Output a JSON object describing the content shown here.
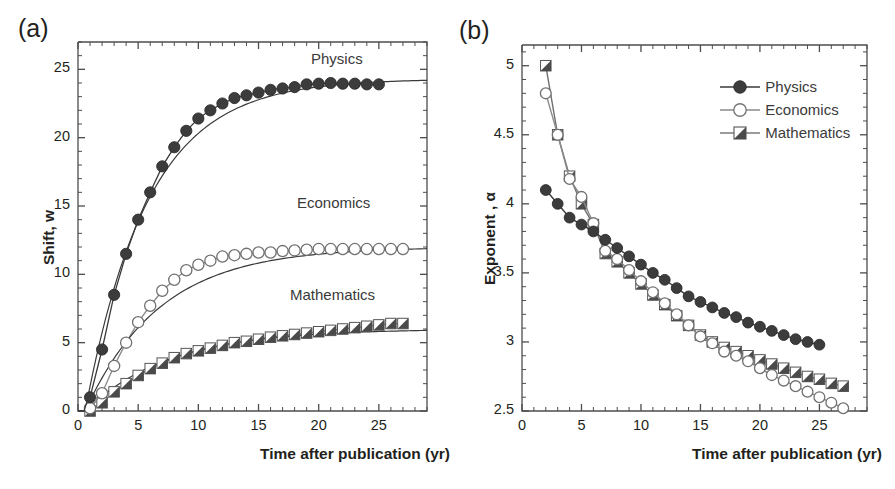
{
  "figure": {
    "panels": [
      {
        "tag": "(a)",
        "xlabel": "Time after publication (yr)",
        "ylabel": "Shift, w",
        "xticks": [
          0,
          5,
          10,
          15,
          20,
          25
        ],
        "yticks": [
          0,
          5,
          10,
          15,
          20,
          25
        ],
        "inplot_labels": [
          "Physics",
          "Economics",
          "Mathematics"
        ]
      },
      {
        "tag": "(b)",
        "xlabel": "Time after publication (yr)",
        "ylabel": "Exponent , α",
        "xticks": [
          0,
          5,
          10,
          15,
          20,
          25
        ],
        "yticks": [
          "2.5",
          "3",
          "3.5",
          "4",
          "4.5",
          "5"
        ],
        "legend": [
          "Physics",
          "Economics",
          "Mathematics"
        ]
      }
    ]
  },
  "colors": {
    "physics": "#3c3c3c",
    "economics": "#ffffff",
    "economics_edge": "#707070",
    "mathematics_fill": "#4a4a4a",
    "mathematics_edge": "#555555",
    "axis": "#4d4d4d",
    "text": "#231f20",
    "fitline": "#3a3a3a"
  },
  "chart_data": [
    {
      "type": "scatter",
      "panel": "a",
      "title": "",
      "xlabel": "Time after publication (yr)",
      "ylabel": "Shift, w",
      "xlim": [
        0,
        29
      ],
      "ylim": [
        0,
        27
      ],
      "grid": false,
      "legend_position": "in-plot annotations at right",
      "x": [
        1,
        2,
        3,
        4,
        5,
        6,
        7,
        8,
        9,
        10,
        11,
        12,
        13,
        14,
        15,
        16,
        17,
        18,
        19,
        20,
        21,
        22,
        23,
        24,
        25
      ],
      "series": [
        {
          "name": "Physics",
          "marker": "filled-circle",
          "values": [
            1.0,
            4.5,
            8.5,
            11.5,
            14.0,
            16.0,
            17.9,
            19.3,
            20.5,
            21.4,
            22.0,
            22.5,
            22.9,
            23.1,
            23.3,
            23.5,
            23.6,
            23.7,
            23.9,
            23.95,
            24.0,
            23.95,
            23.95,
            23.9,
            23.9
          ],
          "fit_asymptote": 24.3
        },
        {
          "name": "Economics",
          "marker": "open-circle",
          "x": [
            1,
            2,
            3,
            4,
            5,
            6,
            7,
            8,
            9,
            10,
            11,
            12,
            13,
            14,
            15,
            16,
            17,
            18,
            19,
            20,
            21,
            22,
            23,
            24,
            25,
            26,
            27
          ],
          "values": [
            0.2,
            1.3,
            3.3,
            5.0,
            6.5,
            7.7,
            8.8,
            9.6,
            10.3,
            10.7,
            11.0,
            11.3,
            11.4,
            11.5,
            11.6,
            11.6,
            11.7,
            11.75,
            11.8,
            11.85,
            11.85,
            11.85,
            11.85,
            11.85,
            11.85,
            11.85,
            11.85
          ],
          "fit_asymptote": 12.0
        },
        {
          "name": "Mathematics",
          "marker": "half-filled-square",
          "x": [
            1,
            2,
            3,
            4,
            5,
            6,
            7,
            8,
            9,
            10,
            11,
            12,
            13,
            14,
            15,
            16,
            17,
            18,
            19,
            20,
            21,
            22,
            23,
            24,
            25,
            26,
            27
          ],
          "values": [
            0.0,
            0.6,
            1.4,
            2.0,
            2.6,
            3.1,
            3.5,
            3.9,
            4.2,
            4.4,
            4.6,
            4.8,
            5.0,
            5.1,
            5.25,
            5.4,
            5.5,
            5.6,
            5.7,
            5.8,
            5.9,
            6.0,
            6.1,
            6.2,
            6.3,
            6.4,
            6.4
          ],
          "fit_asymptote": 6.0
        }
      ]
    },
    {
      "type": "scatter",
      "panel": "b",
      "title": "",
      "xlabel": "Time after publication (yr)",
      "ylabel": "Exponent , α",
      "xlim": [
        0,
        29
      ],
      "ylim": [
        2.5,
        5.15
      ],
      "grid": false,
      "legend_position": "upper-right",
      "series": [
        {
          "name": "Physics",
          "marker": "filled-circle",
          "x": [
            2,
            3,
            4,
            5,
            6,
            7,
            8,
            9,
            10,
            11,
            12,
            13,
            14,
            15,
            16,
            17,
            18,
            19,
            20,
            21,
            22,
            23,
            24,
            25
          ],
          "values": [
            4.1,
            4.0,
            3.9,
            3.85,
            3.8,
            3.74,
            3.68,
            3.62,
            3.56,
            3.5,
            3.45,
            3.39,
            3.33,
            3.29,
            3.25,
            3.21,
            3.18,
            3.14,
            3.11,
            3.08,
            3.05,
            3.02,
            3.0,
            2.98
          ]
        },
        {
          "name": "Economics",
          "marker": "open-circle",
          "x": [
            2,
            3,
            4,
            5,
            6,
            7,
            8,
            9,
            10,
            11,
            12,
            13,
            14,
            15,
            16,
            17,
            18,
            19,
            20,
            21,
            22,
            23,
            24,
            25,
            26,
            27
          ],
          "values": [
            4.8,
            4.5,
            4.18,
            4.05,
            3.86,
            3.66,
            3.6,
            3.52,
            3.44,
            3.36,
            3.28,
            3.2,
            3.12,
            3.04,
            2.99,
            2.93,
            2.9,
            2.86,
            2.81,
            2.76,
            2.72,
            2.68,
            2.64,
            2.6,
            2.56,
            2.52
          ]
        },
        {
          "name": "Mathematics",
          "marker": "half-filled-square",
          "x": [
            2,
            3,
            4,
            5,
            6,
            7,
            8,
            9,
            10,
            11,
            12,
            13,
            14,
            15,
            16,
            17,
            18,
            19,
            20,
            21,
            22,
            23,
            24,
            25,
            26,
            27
          ],
          "values": [
            5.0,
            4.5,
            4.2,
            4.0,
            3.85,
            3.64,
            3.58,
            3.5,
            3.42,
            3.34,
            3.27,
            3.19,
            3.12,
            3.05,
            3.0,
            2.96,
            2.93,
            2.9,
            2.87,
            2.84,
            2.81,
            2.78,
            2.75,
            2.73,
            2.7,
            2.68
          ]
        }
      ]
    }
  ]
}
